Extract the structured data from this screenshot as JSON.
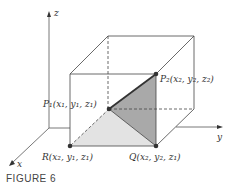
{
  "figure": {
    "caption": "FIGURE 6",
    "axes": {
      "x": "x",
      "y": "y",
      "z": "z"
    },
    "points": {
      "P1": {
        "label": "P₁(x₁, y₁, z₁)"
      },
      "P2": {
        "label": "P₂(x₂, y₂, z₂)"
      },
      "R": {
        "label": "R(x₂, y₁, z₁)"
      },
      "Q": {
        "label": "Q(x₂, y₂, z₁)"
      }
    },
    "colors": {
      "line": "#333333",
      "light_triangle": "#e3e3e3",
      "dark_triangle": "#a9a9a9",
      "point": "#333333"
    }
  }
}
